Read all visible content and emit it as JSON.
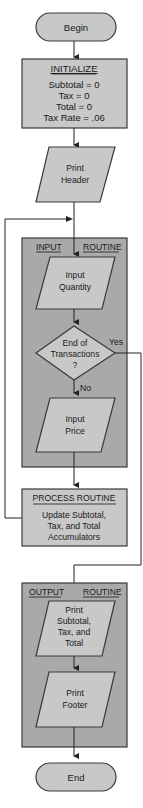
{
  "diagram": {
    "colors": {
      "shape_fill": "#c8c8c8",
      "routine_fill": "#a9a9a9",
      "stroke": "#3a3a3a",
      "text": "#1a1a1a"
    },
    "begin": {
      "label": "Begin"
    },
    "initialize": {
      "title": "INITIALIZE",
      "lines": [
        "Subtotal = 0",
        "Tax = 0",
        "Total = 0",
        "Tax Rate = .06"
      ]
    },
    "print_header": {
      "lines": [
        "Print",
        "Header"
      ]
    },
    "input_routine": {
      "title_left": "INPUT",
      "title_right": "ROUTINE",
      "input_quantity": {
        "lines": [
          "Input",
          "Quantity"
        ]
      },
      "decision": {
        "lines": [
          "End of",
          "Transactions",
          "?"
        ],
        "yes_label": "Yes",
        "no_label": "No"
      },
      "input_price": {
        "lines": [
          "Input",
          "Price"
        ]
      }
    },
    "process_routine": {
      "title": "PROCESS ROUTINE",
      "lines": [
        "Update Subtotal,",
        "Tax, and Total",
        "Accumulators"
      ]
    },
    "output_routine": {
      "title_left": "OUTPUT",
      "title_right": "ROUTINE",
      "print_totals": {
        "lines": [
          "Print",
          "Subtotal,",
          "Tax, and",
          "Total"
        ]
      },
      "print_footer": {
        "lines": [
          "Print",
          "Footer"
        ]
      }
    },
    "end": {
      "label": "End"
    }
  }
}
